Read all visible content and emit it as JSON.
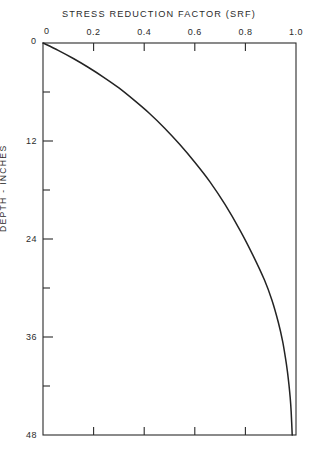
{
  "figure": {
    "title": "STRESS  REDUCTION  FACTOR  (SRF)",
    "ylabel": "DEPTH  -  INCHES",
    "origin_x_label": "0",
    "origin_y_label": "0",
    "caption": ""
  },
  "chart_data": {
    "type": "line",
    "title": "STRESS  REDUCTION  FACTOR  (SRF)",
    "xlabel": "STRESS REDUCTION FACTOR (SRF)",
    "ylabel": "DEPTH - INCHES",
    "xlim": [
      0,
      1.0
    ],
    "ylim": [
      0,
      48
    ],
    "y_inverted": true,
    "x_axis_position": "top",
    "grid": false,
    "legend": null,
    "xticks": [
      0,
      0.2,
      0.4,
      0.6,
      0.8,
      1.0
    ],
    "xtick_labels": [
      "0",
      "0.2",
      "0.4",
      "0.6",
      "0.8",
      "1.0"
    ],
    "yticks": [
      0,
      12,
      24,
      36,
      48
    ],
    "ytick_labels": [
      "0",
      "12",
      "24",
      "36",
      "48"
    ],
    "y_minor_ticks": [
      6,
      18,
      30,
      42
    ],
    "series": [
      {
        "name": "SRF vs depth",
        "color": "#232323",
        "x": [
          0.0,
          0.06,
          0.12,
          0.18,
          0.24,
          0.3,
          0.36,
          0.42,
          0.48,
          0.54,
          0.6,
          0.66,
          0.72,
          0.78,
          0.83,
          0.875,
          0.905,
          0.93,
          0.947,
          0.958,
          0.966,
          0.972,
          0.977,
          0.981,
          0.985
        ],
        "y": [
          0.0,
          0.9,
          1.9,
          3.0,
          4.2,
          5.5,
          7.0,
          8.6,
          10.4,
          12.4,
          14.6,
          17.0,
          19.8,
          23.0,
          26.0,
          29.0,
          31.5,
          34.2,
          36.5,
          38.5,
          40.2,
          41.8,
          43.4,
          45.2,
          48.0
        ]
      }
    ]
  },
  "axis_geometry": {
    "left_px": 43,
    "right_px": 296,
    "top_px": 43,
    "bottom_px": 435
  }
}
